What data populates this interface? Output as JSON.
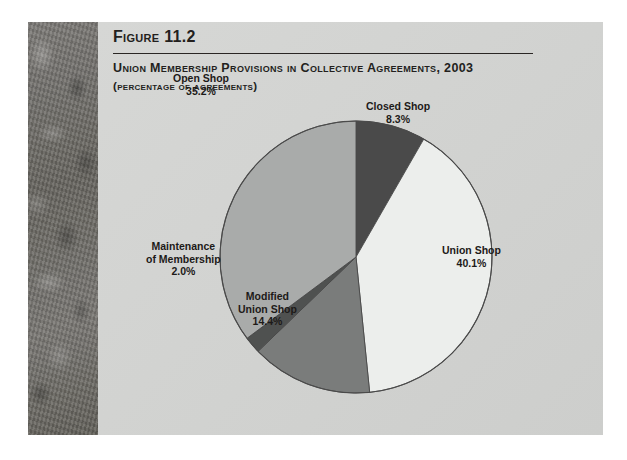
{
  "figure": {
    "number": "Figure 11.2",
    "title": "Union Membership Provisions in Collective Agreements, 2003",
    "subtitle": "(percentage of agreements)"
  },
  "chart_data": {
    "type": "pie",
    "title": "Union Membership Provisions in Collective Agreements, 2003",
    "subtitle": "(percentage of agreements)",
    "ylabel": "",
    "xlabel": "",
    "units": "percent",
    "legend_position": "outside-labels",
    "start_angle_deg": 0,
    "direction": "clockwise",
    "categories": [
      "Closed Shop",
      "Union Shop",
      "Modified Union Shop",
      "Maintenance of Membership",
      "Open Shop"
    ],
    "values": [
      8.3,
      40.1,
      14.4,
      2.0,
      35.2
    ],
    "slices": [
      {
        "name": "Closed Shop",
        "value": 8.3,
        "value_label": "8.3%",
        "color": "#4a4a4a",
        "label_line1": "Closed Shop",
        "label_line2": "",
        "label_pct": "8.3%"
      },
      {
        "name": "Union Shop",
        "value": 40.1,
        "value_label": "40.1%",
        "color": "#eceeec",
        "label_line1": "Union Shop",
        "label_line2": "",
        "label_pct": "40.1%"
      },
      {
        "name": "Modified Union Shop",
        "value": 14.4,
        "value_label": "14.4%",
        "color": "#7a7c7b",
        "label_line1": "Modified",
        "label_line2": "Union Shop",
        "label_pct": "14.4%"
      },
      {
        "name": "Maintenance of Membership",
        "value": 2.0,
        "value_label": "2.0%",
        "color": "#4f5150",
        "label_line1": "Maintenance",
        "label_line2": "of Membership",
        "label_pct": "2.0%"
      },
      {
        "name": "Open Shop",
        "value": 35.2,
        "value_label": "35.2%",
        "color": "#a9abaa",
        "label_line1": "Open Shop",
        "label_line2": "",
        "label_pct": "35.2%"
      }
    ],
    "outline_color": "#4a4a4a",
    "background_color": "#d3d4d2"
  },
  "colors": {
    "page_background": "#ffffff",
    "panel_background": "#d3d4d2",
    "spine": "#6f6f6d",
    "text": "#231f1d",
    "rule": "#2a2624"
  }
}
